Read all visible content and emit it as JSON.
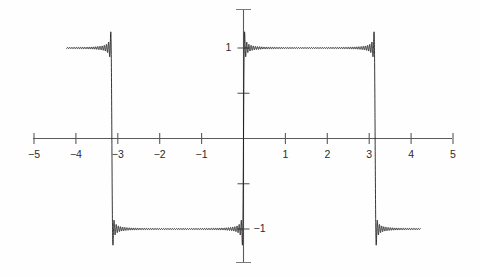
{
  "chart_data": {
    "type": "line",
    "title": "",
    "subtitle": "",
    "xlabel": "",
    "ylabel": "",
    "xlim": [
      -5,
      5
    ],
    "ylim": [
      -1.45,
      1.45
    ],
    "grid": false,
    "legend": null,
    "annotations": [],
    "x_ticks": [
      -5,
      -4,
      -3,
      -2,
      -1,
      0,
      1,
      2,
      3,
      4,
      5
    ],
    "x_tick_labels": [
      "−5",
      "−4",
      "−3",
      "−2",
      "−1",
      "",
      "1",
      "2",
      "3",
      "4",
      "5"
    ],
    "y_ticks": [
      -1,
      -0.5,
      0.5,
      1
    ],
    "y_tick_labels": [
      "−1",
      "",
      "",
      "1"
    ],
    "series": [
      {
        "name": "square wave partial sum",
        "color": "#1a1a1a",
        "period": 6.283185,
        "amplitude": 1,
        "harmonics": 61,
        "x_start": -4.22,
        "x_end": 4.22,
        "discontinuities": [
          -3.141593,
          0,
          3.141593
        ],
        "overshoot": 1.179,
        "plateau_values": [
          1,
          -1
        ],
        "segments": [
          {
            "x_from": -4.22,
            "x_to": -3.141593,
            "value": 1
          },
          {
            "x_from": -3.141593,
            "x_to": 0,
            "value": -1
          },
          {
            "x_from": 0,
            "x_to": 3.141593,
            "value": 1
          },
          {
            "x_from": 3.141593,
            "x_to": 4.22,
            "value": -1
          }
        ]
      }
    ]
  },
  "axes": {
    "x_axis_name": "horizontal-axis",
    "y_axis_name": "vertical-axis",
    "axis_color": "#5a5a5a",
    "curve_color": "#141414",
    "background_color": "#fefefe"
  },
  "labels": {
    "x": [
      {
        "text": "−5",
        "value": -5
      },
      {
        "text": "−4",
        "value": -4
      },
      {
        "text": "−3",
        "value": -3
      },
      {
        "text": "−2",
        "value": -2
      },
      {
        "text": "−1",
        "value": -1
      },
      {
        "text": "1",
        "value": 1
      },
      {
        "text": "2",
        "value": 2
      },
      {
        "text": "3",
        "value": 3
      },
      {
        "text": "4",
        "value": 4
      },
      {
        "text": "5",
        "value": 5
      }
    ],
    "y": [
      {
        "text": "1",
        "value": 1
      },
      {
        "text": "−1",
        "value": -1
      }
    ]
  }
}
